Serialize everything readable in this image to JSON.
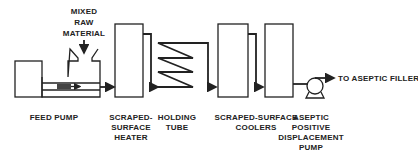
{
  "diagram": {
    "labels": {
      "raw_material": [
        "MIXED",
        "RAW",
        "MATERIAL"
      ],
      "feed_pump": "FEED PUMP",
      "heater": [
        "SCRAPED-",
        "SURFACE",
        "HEATER"
      ],
      "holding_tube": [
        "HOLDING",
        "TUBE"
      ],
      "coolers": [
        "SCRAPED-SURFACE",
        "COOLERS"
      ],
      "aseptic_pump": [
        "ASEPTIC",
        "POSITIVE",
        "DISPLACEMENT",
        "PUMP"
      ],
      "outlet": "TO ASEPTIC FILLER"
    },
    "components": [
      "feed-pump",
      "scraped-surface-heater",
      "holding-tube",
      "scraped-surface-cooler-1",
      "scraped-surface-cooler-2",
      "aseptic-positive-displacement-pump"
    ]
  }
}
